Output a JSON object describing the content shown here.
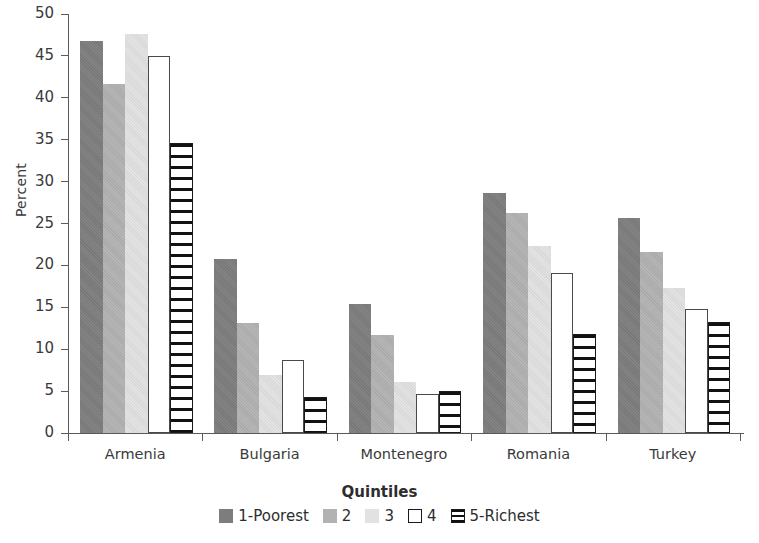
{
  "chart_data": {
    "type": "bar",
    "title": "",
    "xlabel": "",
    "ylabel": "Percent",
    "ylim": [
      0,
      50
    ],
    "ytick_step": 5,
    "yticks": [
      0,
      5,
      10,
      15,
      20,
      25,
      30,
      35,
      40,
      45,
      50
    ],
    "grid": false,
    "legend_position": "bottom",
    "legend_title": "Quintiles",
    "categories": [
      "Armenia",
      "Bulgaria",
      "Montenegro",
      "Romania",
      "Turkey"
    ],
    "series": [
      {
        "name": "1-Poorest",
        "color": "#7d7d7d",
        "values": [
          46.8,
          20.8,
          15.4,
          28.6,
          25.6
        ]
      },
      {
        "name": "2",
        "color": "#b2b2b2",
        "values": [
          41.7,
          13.1,
          11.7,
          26.2,
          21.6
        ]
      },
      {
        "name": "3",
        "color": "#e2e2e2",
        "values": [
          47.6,
          6.9,
          6.1,
          22.3,
          17.3
        ]
      },
      {
        "name": "4",
        "color": "#ffffff",
        "values": [
          45.0,
          8.7,
          4.7,
          19.1,
          14.8
        ]
      },
      {
        "name": "5-Richest",
        "color": "#ffffff",
        "values": [
          34.6,
          4.3,
          5.0,
          11.8,
          13.2
        ]
      }
    ]
  },
  "axis": {
    "y_label": "Percent",
    "y_tick_labels": [
      "50",
      "45",
      "40",
      "35",
      "30",
      "25",
      "20",
      "15",
      "10",
      "5",
      "0"
    ],
    "x_tick_labels": [
      "Armenia",
      "Bulgaria",
      "Montenegro",
      "Romania",
      "Turkey"
    ]
  },
  "legend": {
    "title": "Quintiles",
    "items": [
      {
        "label": "1-Poorest",
        "swatch": "solid-dark-gray"
      },
      {
        "label": "2",
        "swatch": "solid-medium-gray"
      },
      {
        "label": "3",
        "swatch": "solid-light-gray"
      },
      {
        "label": "4",
        "swatch": "outline-white"
      },
      {
        "label": "5-Richest",
        "swatch": "horizontal-stripes"
      }
    ]
  }
}
